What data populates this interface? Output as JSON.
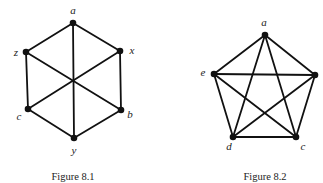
{
  "figures": [
    {
      "id": "fig81",
      "caption": "Figure 8.1",
      "caption_pos": [
        73,
        180
      ],
      "nodes": [
        {
          "id": "a",
          "label": "a",
          "x": 73,
          "y": 23,
          "lx": 73,
          "ly": 14,
          "anchor": "middle"
        },
        {
          "id": "z",
          "label": "z",
          "x": 26,
          "y": 52,
          "lx": 16,
          "ly": 56,
          "anchor": "middle"
        },
        {
          "id": "x",
          "label": "x",
          "x": 120,
          "y": 51,
          "lx": 132,
          "ly": 54,
          "anchor": "middle"
        },
        {
          "id": "c",
          "label": "c",
          "x": 28,
          "y": 109,
          "lx": 19,
          "ly": 120,
          "anchor": "middle"
        },
        {
          "id": "b",
          "label": "b",
          "x": 121,
          "y": 110,
          "lx": 130,
          "ly": 118,
          "anchor": "middle"
        },
        {
          "id": "y",
          "label": "y",
          "x": 74,
          "y": 138,
          "lx": 74,
          "ly": 154,
          "anchor": "middle"
        }
      ],
      "edges": [
        [
          "a",
          "z"
        ],
        [
          "a",
          "x"
        ],
        [
          "a",
          "y"
        ],
        [
          "z",
          "c"
        ],
        [
          "z",
          "b"
        ],
        [
          "x",
          "b"
        ],
        [
          "x",
          "c"
        ],
        [
          "c",
          "y"
        ],
        [
          "b",
          "y"
        ]
      ]
    },
    {
      "id": "fig82",
      "caption": "Figure 8.2",
      "caption_pos": [
        265,
        180
      ],
      "nodes": [
        {
          "id": "a",
          "label": "a",
          "x": 265,
          "y": 35,
          "lx": 264,
          "ly": 26,
          "anchor": "middle"
        },
        {
          "id": "e",
          "label": "e",
          "x": 214,
          "y": 74,
          "lx": 203,
          "ly": 76,
          "anchor": "middle"
        },
        {
          "id": "b",
          "label": "",
          "x": 315,
          "y": 75,
          "lx": 323,
          "ly": 78,
          "anchor": "middle"
        },
        {
          "id": "d",
          "label": "d",
          "x": 233,
          "y": 137,
          "lx": 229,
          "ly": 150,
          "anchor": "middle"
        },
        {
          "id": "c",
          "label": "c",
          "x": 296,
          "y": 137,
          "lx": 303,
          "ly": 150,
          "anchor": "middle"
        }
      ],
      "edges": [
        [
          "a",
          "e"
        ],
        [
          "a",
          "b"
        ],
        [
          "a",
          "d"
        ],
        [
          "a",
          "c"
        ],
        [
          "e",
          "b"
        ],
        [
          "e",
          "d"
        ],
        [
          "e",
          "c"
        ],
        [
          "b",
          "d"
        ],
        [
          "b",
          "c"
        ],
        [
          "d",
          "c"
        ]
      ]
    }
  ]
}
